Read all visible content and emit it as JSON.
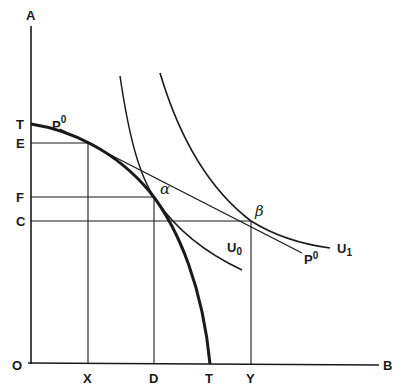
{
  "figure": {
    "type": "production possibility frontier with indifference curves",
    "axes": {
      "vertical_label": "A",
      "horizontal_label": "B",
      "origin_label": "O"
    },
    "vertical_ticks": [
      {
        "label": "T",
        "role": "max-A intercept of frontier"
      },
      {
        "label": "E",
        "role": "A produced at P0 tangency"
      },
      {
        "label": "F",
        "role": "A consumed at alpha"
      },
      {
        "label": "C",
        "role": "A consumed at beta"
      }
    ],
    "horizontal_ticks": [
      {
        "label": "X",
        "role": "B produced at P0 tangency"
      },
      {
        "label": "D",
        "role": "B consumed at alpha"
      },
      {
        "label": "T",
        "role": "max-B intercept of frontier"
      },
      {
        "label": "Y",
        "role": "B consumed at beta"
      }
    ],
    "curves": {
      "frontier": "TT",
      "price_line_label_top": "P",
      "price_line_sup_top": "0",
      "price_line_label_bottom": "P",
      "price_line_sup_bottom": "0",
      "indifference_low_label": "U",
      "indifference_low_sub": "0",
      "indifference_high_label": "U",
      "indifference_high_sub": "1"
    },
    "points": {
      "alpha": "α",
      "beta": "β"
    }
  }
}
